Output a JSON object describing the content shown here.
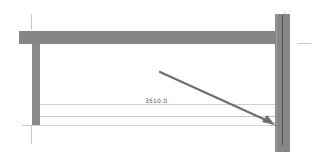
{
  "drawing": {
    "type": "CAD structural frame view",
    "dimension_label": "3510.0",
    "colors": {
      "background": "#ffffff",
      "member_fill": "#868686",
      "member_centerline": "#555555",
      "dimension_line": "#cfcfcf",
      "arrow": "#6e6e6e"
    },
    "members": [
      {
        "name": "top-beam",
        "orientation": "horizontal"
      },
      {
        "name": "left-column",
        "orientation": "vertical"
      },
      {
        "name": "right-column",
        "orientation": "vertical"
      }
    ],
    "arrow": {
      "from": [
        160,
        72
      ],
      "to": [
        274,
        124
      ]
    }
  }
}
